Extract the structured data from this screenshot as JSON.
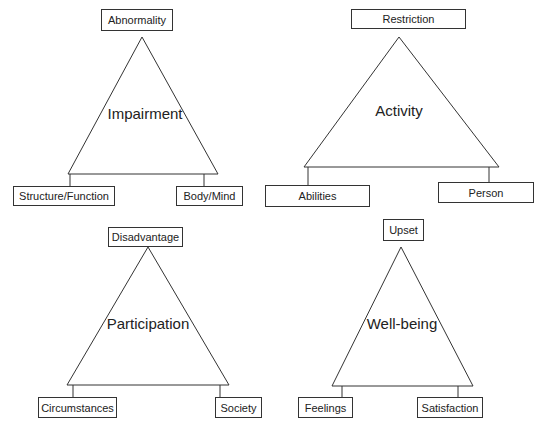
{
  "diagrams": [
    {
      "center": "Impairment",
      "top": "Abnormality",
      "bottom_left": "Structure/Function",
      "bottom_right": "Body/Mind"
    },
    {
      "center": "Activity",
      "top": "Restriction",
      "bottom_left": "Abilities",
      "bottom_right": "Person"
    },
    {
      "center": "Participation",
      "top": "Disadvantage",
      "bottom_left": "Circumstances",
      "bottom_right": "Society"
    },
    {
      "center": "Well-being",
      "top": "Upset",
      "bottom_left": "Feelings",
      "bottom_right": "Satisfaction"
    }
  ]
}
